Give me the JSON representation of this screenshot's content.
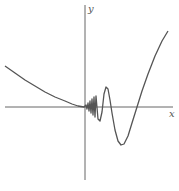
{
  "chart_data": {
    "type": "line",
    "title": "",
    "xlabel": "x",
    "ylabel": "y",
    "grid": false,
    "legend": null,
    "ticks": "none",
    "series": [
      {
        "name": "f(x)",
        "points_px": [
          [
            5,
            66
          ],
          [
            15,
            73
          ],
          [
            25,
            80
          ],
          [
            35,
            86
          ],
          [
            45,
            92
          ],
          [
            55,
            97
          ],
          [
            65,
            101
          ],
          [
            72,
            104
          ],
          [
            78,
            106
          ],
          [
            84,
            107
          ],
          [
            86,
            105
          ],
          [
            87,
            109
          ],
          [
            88,
            103
          ],
          [
            89,
            111
          ],
          [
            90,
            101
          ],
          [
            91,
            113
          ],
          [
            92,
            99
          ],
          [
            93,
            115
          ],
          [
            94,
            97
          ],
          [
            95,
            117
          ],
          [
            96,
            96
          ],
          [
            98,
            119
          ],
          [
            100,
            121
          ],
          [
            102,
            112
          ],
          [
            104,
            94
          ],
          [
            106,
            87
          ],
          [
            108,
            89
          ],
          [
            110,
            100
          ],
          [
            112,
            113
          ],
          [
            115,
            130
          ],
          [
            118,
            141
          ],
          [
            121,
            145
          ],
          [
            124,
            144
          ],
          [
            128,
            136
          ],
          [
            132,
            123
          ],
          [
            137,
            107
          ],
          [
            142,
            91
          ],
          [
            148,
            74
          ],
          [
            155,
            56
          ],
          [
            162,
            41
          ],
          [
            168,
            31
          ]
        ]
      }
    ],
    "axes_px": {
      "origin": [
        85,
        107
      ],
      "x_range": [
        5,
        173
      ],
      "y_range": [
        5,
        180
      ]
    }
  },
  "labels": {
    "x": "x",
    "y": "y"
  },
  "colors": {
    "axis": "#666666",
    "curve": "#555555"
  }
}
